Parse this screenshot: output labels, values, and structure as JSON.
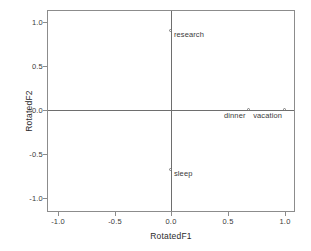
{
  "chart_data": {
    "type": "scatter",
    "title": "",
    "xlabel": "RotatedF1",
    "ylabel": "RotatedF2",
    "xlim": [
      -1.1,
      1.1
    ],
    "ylim": [
      -1.1,
      1.1
    ],
    "xticks": [
      "-1.0",
      "-0.5",
      "0.0",
      "0.5",
      "1.0"
    ],
    "xtick_values": [
      -1.0,
      -0.5,
      0.0,
      0.5,
      1.0
    ],
    "yticks": [
      "1.0",
      "0.5",
      "0.0",
      "-0.5",
      "-1.0"
    ],
    "ytick_values": [
      1.0,
      0.5,
      0.0,
      -0.5,
      -1.0
    ],
    "grid": false,
    "legend": null,
    "reference_lines": {
      "x": 0.0,
      "y": 0.0
    },
    "points": [
      {
        "label": "research",
        "x": 0.0,
        "y": 0.9,
        "label_side": "right"
      },
      {
        "label": "dinner",
        "x": 0.68,
        "y": 0.0,
        "label_side": "left"
      },
      {
        "label": "vacation",
        "x": 1.0,
        "y": 0.0,
        "label_side": "left"
      },
      {
        "label": "sleep",
        "x": 0.0,
        "y": -0.68,
        "label_side": "right"
      }
    ]
  },
  "axes": {
    "x_title": "RotatedF1",
    "y_title": "RotatedF2",
    "x_tick_labels": [
      "-1.0",
      "-0.5",
      "0.0",
      "0.5",
      "1.0"
    ],
    "y_tick_labels": [
      "1.0",
      "0.5",
      "0.0",
      "-0.5",
      "-1.0"
    ]
  },
  "points": {
    "research": "research",
    "dinner": "dinner",
    "vacation": "vacation",
    "sleep": "sleep"
  },
  "colors": {
    "frame": "#8c8c8c",
    "reference_line": "#6e6e6e",
    "marker": "#7a7a7a",
    "text": "#3a3a3a",
    "background": "#ffffff"
  }
}
